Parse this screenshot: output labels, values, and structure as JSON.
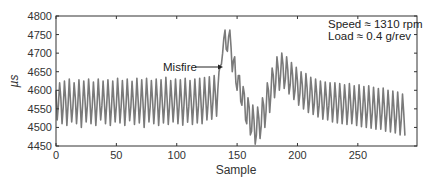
{
  "chart_data": {
    "type": "line",
    "title": "",
    "xlabel": "Sample",
    "ylabel": "µs",
    "xlim": [
      0,
      299
    ],
    "ylim": [
      4450,
      4800
    ],
    "xticks": [
      0,
      50,
      100,
      150,
      200,
      250
    ],
    "yticks": [
      4450,
      4500,
      4550,
      4600,
      4650,
      4700,
      4750,
      4800
    ],
    "grid": false,
    "legend": null,
    "line_color": "#7a7a7a",
    "annotations": [
      {
        "text": "Misfire",
        "type": "arrow",
        "text_at": [
          88,
          4670
        ],
        "arrow_to": [
          140,
          4670
        ]
      },
      {
        "text": "Speed ≈ 1310 rpm",
        "position": "top-right"
      },
      {
        "text": "Load ≈ 0.4 g/rev",
        "position": "top-right"
      }
    ],
    "series": [
      {
        "name": "Crank period",
        "x_start": 0,
        "x_step": 1,
        "values": [
          4600,
          4520,
          4560,
          4620,
          4580,
          4510,
          4555,
          4625,
          4575,
          4505,
          4560,
          4630,
          4570,
          4515,
          4555,
          4620,
          4580,
          4510,
          4560,
          4628,
          4570,
          4500,
          4558,
          4625,
          4575,
          4515,
          4560,
          4630,
          4580,
          4510,
          4555,
          4622,
          4570,
          4505,
          4560,
          4630,
          4575,
          4520,
          4558,
          4625,
          4572,
          4510,
          4560,
          4628,
          4575,
          4505,
          4555,
          4625,
          4570,
          4515,
          4560,
          4632,
          4578,
          4512,
          4558,
          4626,
          4570,
          4505,
          4560,
          4630,
          4575,
          4518,
          4555,
          4624,
          4572,
          4508,
          4560,
          4632,
          4575,
          4512,
          4558,
          4628,
          4570,
          4500,
          4560,
          4632,
          4578,
          4515,
          4555,
          4626,
          4572,
          4510,
          4560,
          4630,
          4575,
          4505,
          4558,
          4628,
          4570,
          4512,
          4560,
          4635,
          4578,
          4508,
          4555,
          4626,
          4574,
          4515,
          4560,
          4630,
          4575,
          4510,
          4558,
          4628,
          4572,
          4506,
          4560,
          4632,
          4576,
          4514,
          4556,
          4626,
          4572,
          4508,
          4560,
          4630,
          4576,
          4512,
          4558,
          4632,
          4574,
          4510,
          4562,
          4634,
          4580,
          4520,
          4565,
          4636,
          4582,
          4522,
          4570,
          4640,
          4590,
          4530,
          4600,
          4650,
          4665,
          4670,
          4700,
          4740,
          4762,
          4710,
          4705,
          4745,
          4762,
          4715,
          4650,
          4680,
          4690,
          4620,
          4600,
          4640,
          4640,
          4570,
          4560,
          4610,
          4590,
          4520,
          4510,
          4580,
          4555,
          4480,
          4490,
          4560,
          4520,
          4455,
          4480,
          4555,
          4525,
          4470,
          4505,
          4580,
          4560,
          4500,
          4545,
          4620,
          4600,
          4540,
          4590,
          4660,
          4640,
          4580,
          4620,
          4690,
          4660,
          4600,
          4640,
          4700,
          4670,
          4605,
          4630,
          4690,
          4655,
          4590,
          4615,
          4675,
          4640,
          4575,
          4600,
          4662,
          4625,
          4560,
          4590,
          4650,
          4615,
          4550,
          4580,
          4645,
          4605,
          4540,
          4572,
          4635,
          4598,
          4535,
          4565,
          4630,
          4590,
          4528,
          4560,
          4625,
          4585,
          4522,
          4558,
          4622,
          4580,
          4520,
          4558,
          4620,
          4578,
          4515,
          4555,
          4620,
          4575,
          4512,
          4555,
          4618,
          4574,
          4510,
          4552,
          4615,
          4572,
          4508,
          4550,
          4618,
          4570,
          4510,
          4550,
          4612,
          4568,
          4505,
          4548,
          4615,
          4566,
          4502,
          4545,
          4610,
          4565,
          4500,
          4545,
          4612,
          4562,
          4498,
          4540,
          4608,
          4560,
          4495,
          4540,
          4605,
          4558,
          4495,
          4538,
          4606,
          4555,
          4490,
          4535,
          4600,
          4552,
          4488,
          4530,
          4598,
          4548,
          4485,
          4528,
          4595,
          4545,
          4480,
          4522,
          4590,
          4540,
          4478
        ]
      }
    ]
  }
}
